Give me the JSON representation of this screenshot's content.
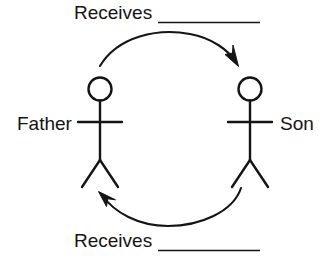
{
  "diagram": {
    "type": "cycle-exchange-diagram",
    "title_text": "",
    "background_color": "#ffffff",
    "stroke_color": "#141414",
    "text_color": "#141414",
    "actors": [
      {
        "id": "father",
        "label": "Father",
        "position": "left"
      },
      {
        "id": "son",
        "label": "Son",
        "position": "right"
      }
    ],
    "flows": [
      {
        "id": "top-flow",
        "label": "Receives",
        "blank_line": "__________",
        "direction": "father-to-son",
        "position": "top"
      },
      {
        "id": "bottom-flow",
        "label": "Receives",
        "blank_line": "__________",
        "direction": "son-to-father",
        "position": "bottom"
      }
    ]
  },
  "labels": {
    "receives_top": "Receives",
    "receives_bottom": "Receives",
    "father": "Father",
    "son": "Son"
  }
}
